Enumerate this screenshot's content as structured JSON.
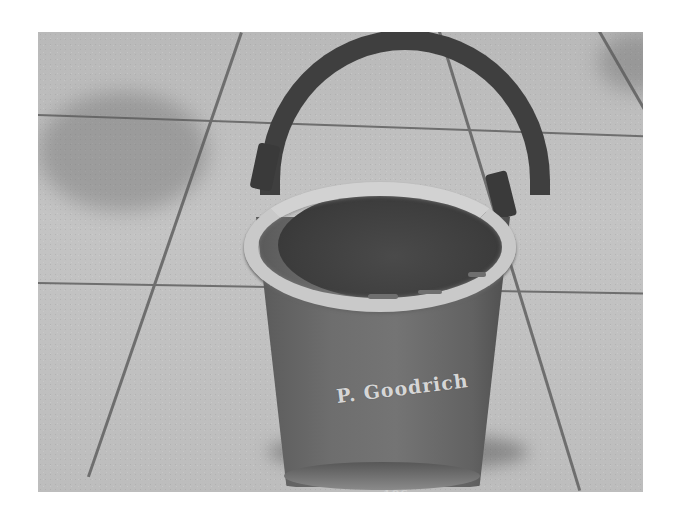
{
  "scene": {
    "description": "Antique leather fire bucket with a rope handle sitting on outdoor concrete paving tiles, grayscale photo",
    "subject": "fire-bucket",
    "background": "concrete-paving-tiles"
  },
  "bucket": {
    "inscription": "P. Goodrich",
    "year_text": "186-"
  },
  "colors": {
    "frame": "#ffffff",
    "tile": "#c0c0c0",
    "tile_joint": "#6e6e6e",
    "bucket_body": "#6a6a6a",
    "bucket_rim": "#cccccc",
    "handle": "#3f3f3f",
    "lettering": "#d6d6d6"
  }
}
